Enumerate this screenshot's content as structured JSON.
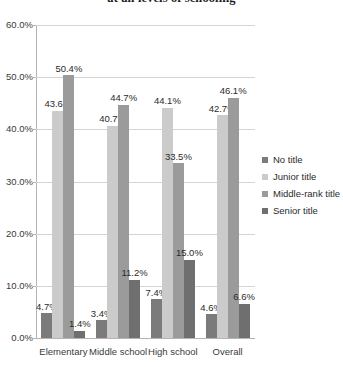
{
  "chart_data": {
    "type": "bar",
    "title": "at all levels of schooling",
    "xlabel": "",
    "ylabel": "",
    "ylim": [
      0,
      60
    ],
    "ytick_labels": [
      "60.0%",
      "50.0%",
      "40.0%",
      "30.0%",
      "20.0%",
      "10.0%",
      "0.0%"
    ],
    "ytick_values": [
      60,
      50,
      40,
      30,
      20,
      10,
      0
    ],
    "grid": true,
    "legend_position": "right",
    "categories": [
      "Elementary",
      "Middle school",
      "High school",
      "Overall"
    ],
    "series": [
      {
        "name": "No title",
        "color": "#7b7b7b",
        "values": [
          4.7,
          3.4,
          7.4,
          4.6
        ],
        "labels": [
          "4.7%",
          "3.4%",
          "7.4%",
          "4.6%"
        ]
      },
      {
        "name": "Junior title",
        "color": "#cbcbcb",
        "values": [
          43.6,
          40.7,
          44.1,
          42.7
        ],
        "labels": [
          "43.6%",
          "40.7%",
          "44.1%",
          "42.7%"
        ]
      },
      {
        "name": "Middle-rank title",
        "color": "#9b9b9b",
        "values": [
          50.4,
          44.7,
          33.5,
          46.1
        ],
        "labels": [
          "50.4%",
          "44.7%",
          "33.5%",
          "46.1%"
        ]
      },
      {
        "name": "Senior title",
        "color": "#6f6f6f",
        "values": [
          1.4,
          11.2,
          15.0,
          6.6
        ],
        "labels": [
          "1.4%",
          "11.2%",
          "15.0%",
          "6.6%"
        ]
      }
    ]
  }
}
